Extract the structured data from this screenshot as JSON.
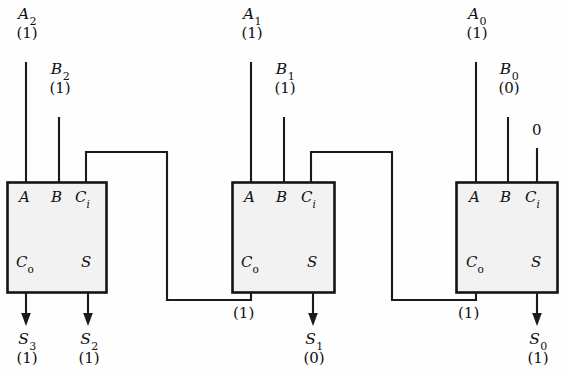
{
  "diagram": {
    "colors": {
      "wire": "#1b1b1b",
      "box_fill": "#f2f2f2",
      "box_stroke": "#141414",
      "background": "#fefefe",
      "text": "#101010"
    },
    "pin_labels": {
      "a": "A",
      "b": "B",
      "ci": "C",
      "ci_sub": "i",
      "co": "C",
      "co_sub": "o",
      "s": "S"
    },
    "stages": [
      {
        "id": "stage-2",
        "inputs": [
          {
            "name": "A",
            "sub": "2",
            "value": "(1)"
          },
          {
            "name": "B",
            "sub": "2",
            "value": "(1)"
          }
        ],
        "outputs": [
          {
            "name": "S",
            "sub": "3",
            "value": "(1)"
          },
          {
            "name": "S",
            "sub": "2",
            "value": "(1)"
          }
        ]
      },
      {
        "id": "stage-1",
        "inputs": [
          {
            "name": "A",
            "sub": "1",
            "value": "(1)"
          },
          {
            "name": "B",
            "sub": "1",
            "value": "(1)"
          }
        ],
        "outputs": [
          {
            "name": "S",
            "sub": "1",
            "value": "(0)"
          }
        ],
        "carry_out_value": "(1)"
      },
      {
        "id": "stage-0",
        "inputs": [
          {
            "name": "A",
            "sub": "0",
            "value": "(1)"
          },
          {
            "name": "B",
            "sub": "0",
            "value": "(0)"
          }
        ],
        "carry_in_constant": "0",
        "outputs": [
          {
            "name": "S",
            "sub": "0",
            "value": "(1)"
          }
        ],
        "carry_out_value": "(1)"
      }
    ]
  }
}
